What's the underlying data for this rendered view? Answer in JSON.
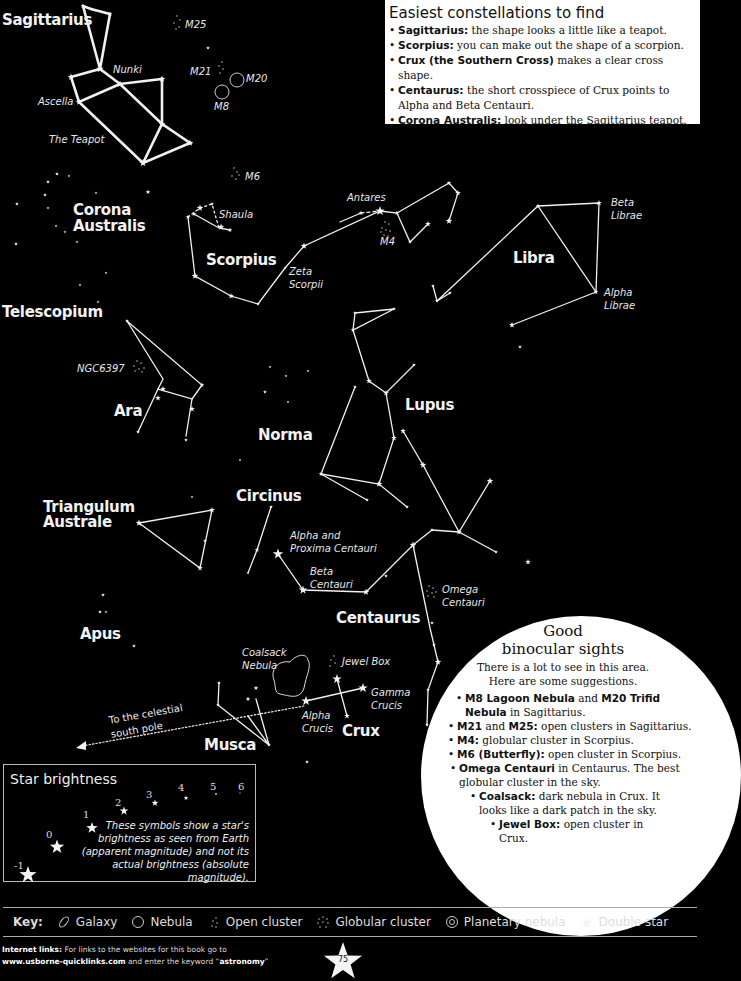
{
  "info_box": {
    "title": "Easiest constellations to find",
    "items": [
      {
        "bold": "Sagittarius:",
        "text": " the shape looks a little like a teapot."
      },
      {
        "bold": "Scorpius:",
        "text": " you can make out the shape of a scorpion."
      },
      {
        "bold": "Crux (the Southern Cross)",
        "text": " makes a clear cross shape."
      },
      {
        "bold": "Centaurus:",
        "text": " the short crosspiece of Crux points to Alpha and Beta Centauri."
      },
      {
        "bold": "Corona Australis:",
        "text": " look under the Sagittarius teapot."
      }
    ]
  },
  "constellations": {
    "sagittarius": "Sagittarius",
    "corona_australis_1": "Corona",
    "corona_australis_2": "Australis",
    "scorpius": "Scorpius",
    "libra": "Libra",
    "telescopium": "Telescopium",
    "ara": "Ara",
    "norma": "Norma",
    "lupus": "Lupus",
    "triangulum_australe_1": "Triangulum",
    "triangulum_australe_2": "Australe",
    "circinus": "Circinus",
    "centaurus": "Centaurus",
    "apus": "Apus",
    "musca": "Musca",
    "crux": "Crux"
  },
  "objects": {
    "nunki": "Nunki",
    "ascella": "Ascella",
    "teapot": "The Teapot",
    "m25": "M25",
    "m21": "M21",
    "m20": "M20",
    "m8": "M8",
    "m6": "M6",
    "shaula": "Shaula",
    "antares": "Antares",
    "m4": "M4",
    "zeta_scorpii_1": "Zeta",
    "zeta_scorpii_2": "Scorpii",
    "beta_librae_1": "Beta",
    "beta_librae_2": "Librae",
    "alpha_librae_1": "Alpha",
    "alpha_librae_2": "Librae",
    "ngc6397": "NGC6397",
    "alpha_proxima_1": "Alpha and",
    "alpha_proxima_2": "Proxima Centauri",
    "beta_centauri_1": "Beta",
    "beta_centauri_2": "Centauri",
    "omega_centauri_1": "Omega",
    "omega_centauri_2": "Centauri",
    "coalsack_1": "Coalsack",
    "coalsack_2": "Nebula",
    "jewel_box": "Jewel Box",
    "gamma_crucis_1": "Gamma",
    "gamma_crucis_2": "Crucis",
    "alpha_crucis_1": "Alpha",
    "alpha_crucis_2": "Crucis",
    "south_pole_1": "To the celestial",
    "south_pole_2": "south pole"
  },
  "binocular": {
    "title_1": "Good",
    "title_2": "binocular sights",
    "intro_1": "There is a lot to see in this area.",
    "intro_2": "Here are some suggestions.",
    "items": [
      {
        "parts": [
          {
            "b": "M8 Lagoon Nebula"
          },
          {
            "t": " and "
          },
          {
            "b": "M20 Trifid Nebula"
          },
          {
            "t": " in Sagittarius."
          }
        ]
      },
      {
        "parts": [
          {
            "b": "M21"
          },
          {
            "t": " and "
          },
          {
            "b": "M25:"
          },
          {
            "t": " open clusters in Sagittarius."
          }
        ]
      },
      {
        "parts": [
          {
            "b": "M4:"
          },
          {
            "t": " globular cluster in Scorpius."
          }
        ]
      },
      {
        "parts": [
          {
            "b": "M6 (Butterfly):"
          },
          {
            "t": " open cluster in Scorpius."
          }
        ]
      },
      {
        "parts": [
          {
            "b": "Omega Centauri"
          },
          {
            "t": " in Centaurus. The best globular cluster in the sky."
          }
        ]
      },
      {
        "parts": [
          {
            "b": "Coalsack:"
          },
          {
            "t": " dark nebula in Crux. It looks like a dark patch in the sky."
          }
        ]
      },
      {
        "parts": [
          {
            "b": "Jewel Box:"
          },
          {
            "t": " open cluster in Crux."
          }
        ]
      }
    ]
  },
  "brightness": {
    "title": "Star brightness",
    "magnitudes": [
      "-1",
      "0",
      "1",
      "2",
      "3",
      "4",
      "5",
      "6"
    ],
    "description": "These symbols show a star's brightness as seen from Earth (apparent magnitude) and not its actual brightness (absolute magnitude)."
  },
  "key": {
    "title": "Key:",
    "items": [
      {
        "icon": "galaxy-icon",
        "label": "Galaxy"
      },
      {
        "icon": "nebula-icon",
        "label": "Nebula"
      },
      {
        "icon": "open-cluster-icon",
        "label": "Open cluster"
      },
      {
        "icon": "globular-cluster-icon",
        "label": "Globular cluster"
      },
      {
        "icon": "planetary-nebula-icon",
        "label": "Planetary nebula"
      },
      {
        "icon": "double-star-icon",
        "label": "Double star"
      }
    ]
  },
  "footer": {
    "label": "Internet links:",
    "line1": " For links to the websites for this book go to",
    "url": "www.usborne-quicklinks.com",
    "line2_mid": " and enter the keyword “",
    "keyword": "astronomy",
    "line2_end": "”"
  },
  "page_number": "75"
}
